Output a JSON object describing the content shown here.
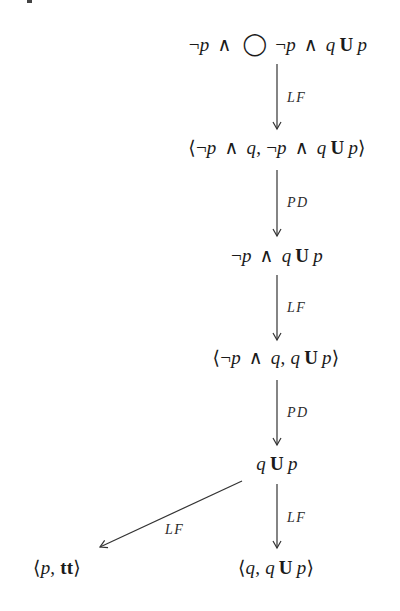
{
  "diagram": {
    "type": "derivation-tree",
    "nodes": [
      {
        "id": "n1",
        "parts": [
          "¬",
          "p",
          "∧",
          "◯",
          "¬",
          "p",
          "∧",
          "q",
          "U",
          "p"
        ],
        "text": "¬p ∧ ◯ ¬p ∧ q U p"
      },
      {
        "id": "n2",
        "parts": [
          "⟨",
          "¬",
          "p",
          "∧",
          "q",
          ",",
          "¬",
          "p",
          "∧",
          "q",
          "U",
          "p",
          "⟩"
        ],
        "text": "⟨¬p ∧ q, ¬p ∧ q U p⟩"
      },
      {
        "id": "n3",
        "parts": [
          "¬",
          "p",
          "∧",
          "q",
          "U",
          "p"
        ],
        "text": "¬p ∧ q U p"
      },
      {
        "id": "n4",
        "parts": [
          "⟨",
          "¬",
          "p",
          "∧",
          "q",
          ",",
          "q",
          "U",
          "p",
          "⟩"
        ],
        "text": "⟨¬p ∧ q, q U p⟩"
      },
      {
        "id": "n5",
        "parts": [
          "q",
          "U",
          "p"
        ],
        "text": "q U p"
      },
      {
        "id": "n6",
        "parts": [
          "⟨",
          "p",
          ",",
          "tt",
          "⟩"
        ],
        "text": "⟨p, tt⟩"
      },
      {
        "id": "n7",
        "parts": [
          "⟨",
          "q",
          ",",
          "q",
          "U",
          "p",
          "⟩"
        ],
        "text": "⟨q, q U p⟩"
      }
    ],
    "edges": [
      {
        "from": "n1",
        "to": "n2",
        "label": "LF"
      },
      {
        "from": "n2",
        "to": "n3",
        "label": "PD"
      },
      {
        "from": "n3",
        "to": "n4",
        "label": "LF"
      },
      {
        "from": "n4",
        "to": "n5",
        "label": "PD"
      },
      {
        "from": "n5",
        "to": "n6",
        "label": "LF"
      },
      {
        "from": "n5",
        "to": "n7",
        "label": "LF"
      }
    ],
    "colors": {
      "ink": "#1a1a1a",
      "arrow": "#333333",
      "background": "#ffffff"
    }
  }
}
